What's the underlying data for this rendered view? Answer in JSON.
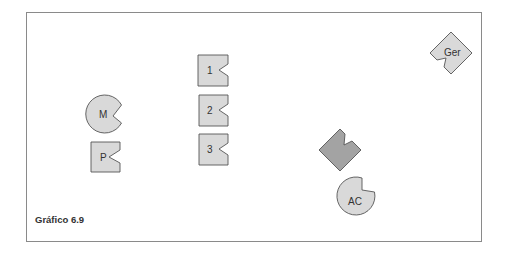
{
  "caption": "Gráfico 6.9",
  "colors": {
    "light_fill": "#d9d9d9",
    "dark_fill": "#a3a3a3",
    "stroke": "#555555",
    "frame": "#8a8a8a"
  },
  "shapes": [
    {
      "id": "M",
      "type": "notched-circle",
      "label": "M",
      "fill": "light"
    },
    {
      "id": "P",
      "type": "notched-square",
      "label": "P",
      "fill": "light"
    },
    {
      "id": "1",
      "type": "notched-square",
      "label": "1",
      "fill": "light"
    },
    {
      "id": "2",
      "type": "notched-square",
      "label": "2",
      "fill": "light"
    },
    {
      "id": "3",
      "type": "notched-square",
      "label": "3",
      "fill": "light"
    },
    {
      "id": "dark",
      "type": "notched-diamond",
      "label": "",
      "fill": "dark"
    },
    {
      "id": "AC",
      "type": "notched-circle",
      "label": "AC",
      "fill": "light"
    },
    {
      "id": "Ger",
      "type": "notched-diamond",
      "label": "Ger",
      "fill": "light"
    }
  ],
  "labels": {
    "M": "M",
    "P": "P",
    "one": "1",
    "two": "2",
    "three": "3",
    "AC": "AC",
    "Ger": "Ger"
  }
}
